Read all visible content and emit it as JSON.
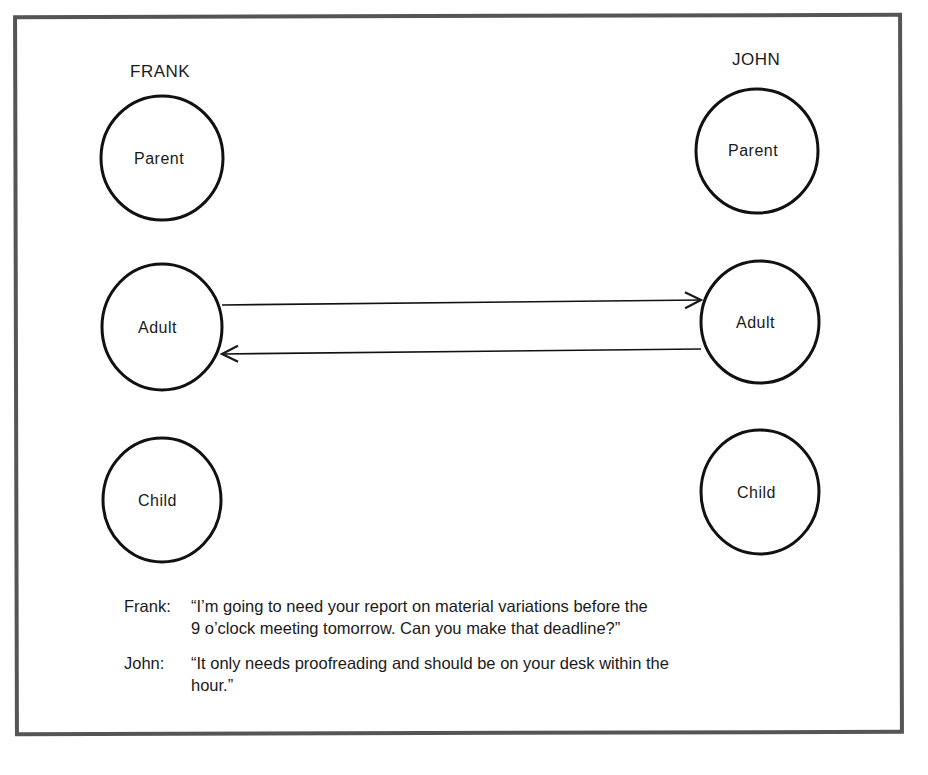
{
  "diagram": {
    "people": [
      {
        "name": "FRANK",
        "states": [
          "Parent",
          "Adult",
          "Child"
        ]
      },
      {
        "name": "JOHN",
        "states": [
          "Parent",
          "Adult",
          "Child"
        ]
      }
    ],
    "arrows": [
      {
        "from": "Frank.Adult",
        "to": "John.Adult"
      },
      {
        "from": "John.Adult",
        "to": "Frank.Adult"
      }
    ]
  },
  "dialogue": [
    {
      "speaker": "Frank:",
      "line1": "“I’m going to need your report on material variations before the",
      "line2": "9 o’clock meeting tomorrow.  Can you make that deadline?”"
    },
    {
      "speaker": "John:",
      "line1": "“It only needs proofreading and should be on your desk within the",
      "line2": "hour.”"
    }
  ]
}
